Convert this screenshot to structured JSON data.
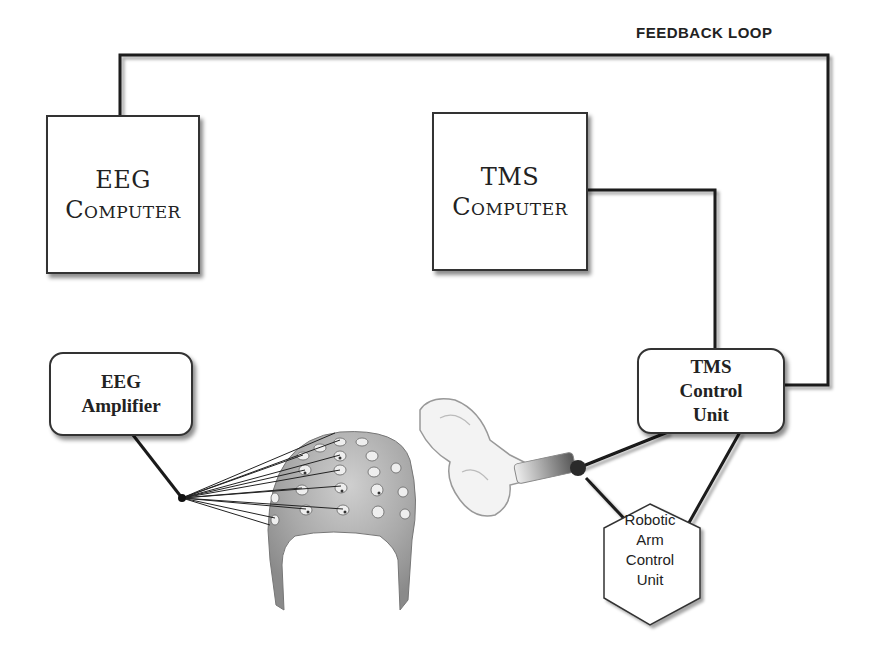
{
  "labels": {
    "feedback_loop": "FEEDBACK LOOP"
  },
  "nodes": {
    "eeg_computer": {
      "line1": "EEG",
      "line2": "Computer"
    },
    "tms_computer": {
      "line1": "TMS",
      "line2": "Computer"
    },
    "eeg_amplifier": {
      "line1": "EEG",
      "line2": "Amplifier"
    },
    "tms_control_unit": {
      "line1": "TMS",
      "line2": "Control",
      "line3": "Unit"
    },
    "robotic_arm_control_unit": {
      "line1": "Robotic",
      "line2": "Arm",
      "line3": "Control",
      "line4": "Unit"
    }
  },
  "images": {
    "eeg_cap": "eeg-electrode-cap",
    "tms_coil": "figure-eight-tms-coil"
  },
  "connections": [
    {
      "from": "eeg_computer",
      "to": "tms_computer"
    },
    {
      "from": "tms_computer",
      "to": "tms_control_unit"
    },
    {
      "from": "eeg_computer",
      "to": "eeg_amplifier"
    },
    {
      "from": "eeg_amplifier",
      "to": "eeg_cap"
    },
    {
      "from": "tms_control_unit",
      "to": "tms_coil"
    },
    {
      "from": "tms_control_unit",
      "to": "robotic_arm_control_unit"
    },
    {
      "from": "tms_coil",
      "to": "robotic_arm_control_unit"
    },
    {
      "from": "tms_control_unit",
      "to": "eeg_computer",
      "label": "FEEDBACK LOOP"
    }
  ]
}
